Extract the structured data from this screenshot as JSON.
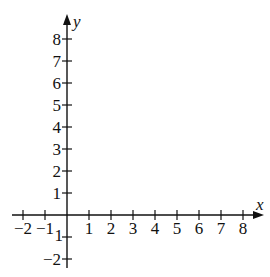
{
  "chart_data": {
    "type": "scatter",
    "title": "",
    "xlabel": "x",
    "ylabel": "y",
    "xlim": [
      -2,
      8
    ],
    "ylim": [
      -2,
      8
    ],
    "x_ticks": [
      -2,
      -1,
      1,
      2,
      3,
      4,
      5,
      6,
      7,
      8
    ],
    "y_ticks": [
      -2,
      -1,
      1,
      2,
      3,
      4,
      5,
      6,
      7,
      8
    ],
    "x_tick_labels": [
      "−2",
      "−1",
      "1",
      "2",
      "3",
      "4",
      "5",
      "6",
      "7",
      "8"
    ],
    "y_tick_labels": [
      "−2",
      "−1",
      "1",
      "2",
      "3",
      "4",
      "5",
      "6",
      "7",
      "8"
    ],
    "grid": false,
    "legend": null,
    "series": [],
    "annotations": [
      "Empty coordinate plane with arrowheads on positive x and y axes"
    ]
  },
  "layout": {
    "origin_px": [
      67,
      215
    ],
    "unit_px": 22,
    "x_axis_start_px": 12,
    "x_axis_end_px": 264,
    "y_axis_top_px": 14,
    "y_axis_bottom_px": 268,
    "axis_color": "#111111"
  }
}
